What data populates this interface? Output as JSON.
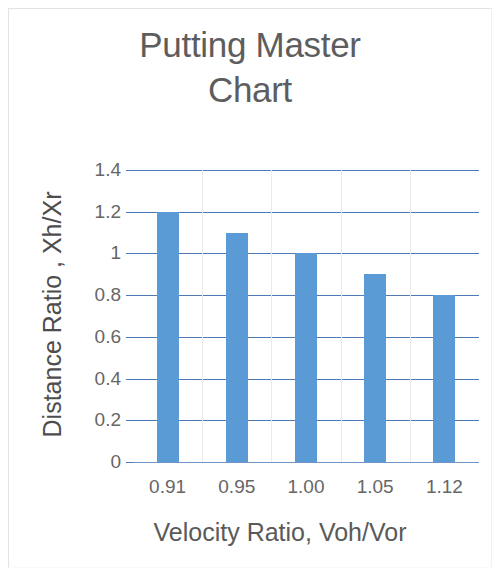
{
  "figure": {
    "width": 500,
    "height": 575,
    "background": "#ffffff",
    "border_color": "#e3e3e3"
  },
  "chart_data": {
    "type": "bar",
    "title": "Putting Master\nChart",
    "title_line1": "Putting Master",
    "title_line2": "Chart",
    "xlabel": "Velocity  Ratio, Voh/Vor",
    "ylabel": "Distance Ratio , Xh/Xr",
    "categories": [
      "0.91",
      "0.95",
      "1.00",
      "1.05",
      "1.12"
    ],
    "values": [
      1.2,
      1.1,
      1.0,
      0.9,
      0.8
    ],
    "series": [
      {
        "name": "Distance Ratio",
        "values": [
          1.2,
          1.1,
          1.0,
          0.9,
          0.8
        ],
        "color": "#5b9bd5"
      }
    ],
    "ylim": [
      0,
      1.4
    ],
    "ytick_values": [
      0,
      0.2,
      0.4,
      0.6,
      0.8,
      1.0,
      1.2,
      1.4
    ],
    "ytick_labels": [
      "0",
      "0.2",
      "0.4",
      "0.6",
      "0.8",
      "1",
      "1.2",
      "1.4"
    ],
    "grid": {
      "horizontal": true,
      "vertical": true,
      "horizontal_color": "#4e7bb5",
      "vertical_color": "#ebebeb"
    },
    "legend": null,
    "legend_position": "none",
    "annotations": [],
    "bar_color": "#5b9bd5",
    "title_color": "#5d5d5d",
    "label_color": "#666666",
    "axis_title_color": "#4d4d4d"
  }
}
